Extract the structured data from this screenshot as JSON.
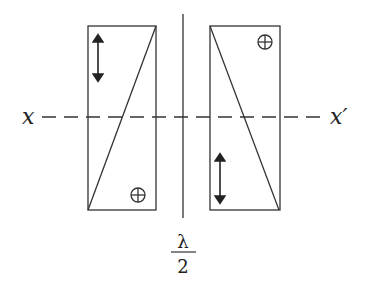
{
  "figure": {
    "axis_left_label": "x",
    "axis_right_label": "x′",
    "gap_label_numerator": "λ",
    "gap_label_denominator": "2",
    "line_color": "#333333",
    "background": "#ffffff"
  },
  "prisms": [
    {
      "name": "left-prism",
      "diagonal": "bottom-left to top-right",
      "polarization_arrow": "vertical double arrow, top-left",
      "out_of_plane_symbol": "⊕",
      "out_of_plane_position": "bottom-right"
    },
    {
      "name": "right-prism",
      "diagonal": "top-left to bottom-right",
      "polarization_arrow": "vertical double arrow, bottom-left",
      "out_of_plane_symbol": "⊕",
      "out_of_plane_position": "top-right"
    }
  ]
}
